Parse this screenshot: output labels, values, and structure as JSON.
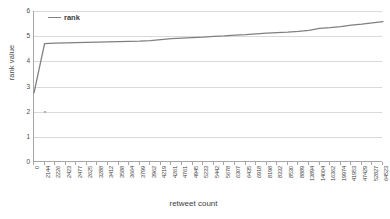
{
  "chart_data": {
    "type": "line",
    "title": "",
    "xlabel": "retweet count",
    "ylabel": "rank value",
    "grid": true,
    "legend_position": "top-left",
    "ylim": [
      0,
      6
    ],
    "yticks": [
      0,
      1,
      2,
      3,
      4,
      5,
      6
    ],
    "ytick_labels": [
      "0",
      "1",
      "2",
      "3",
      "4",
      "5",
      "6"
    ],
    "categories": [
      "0",
      "2144",
      "2226",
      "2423",
      "2477",
      "2625",
      "3288",
      "3412",
      "3588",
      "3664",
      "3799",
      "3962",
      "4219",
      "4261",
      "4761",
      "4945",
      "5233",
      "5442",
      "5678",
      "6307",
      "6435",
      "6918",
      "8198",
      "8332",
      "8530",
      "8889",
      "13894",
      "14004",
      "16362",
      "19974",
      "41953",
      "47429",
      "52827",
      "64523"
    ],
    "series": [
      {
        "name": "rank",
        "color": "#808080",
        "values": [
          2.75,
          4.7,
          4.72,
          4.73,
          4.74,
          4.75,
          4.76,
          4.77,
          4.78,
          4.79,
          4.8,
          4.82,
          4.86,
          4.9,
          4.92,
          4.94,
          4.96,
          4.99,
          5.01,
          5.04,
          5.06,
          5.09,
          5.12,
          5.14,
          5.16,
          5.19,
          5.23,
          5.31,
          5.34,
          5.38,
          5.44,
          5.48,
          5.53,
          5.58
        ]
      }
    ],
    "annotations": [
      {
        "name": "stray-point",
        "x_index": 1,
        "y": 2.0
      }
    ]
  },
  "legend": {
    "entries": [
      {
        "label": "rank",
        "color": "#808080"
      }
    ]
  },
  "axes": {
    "x_title": "retweet count",
    "y_title": "rank value"
  }
}
